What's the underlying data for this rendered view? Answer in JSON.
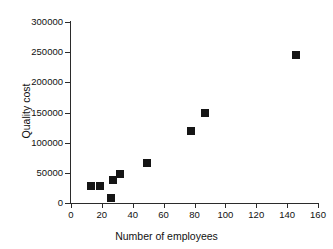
{
  "chart_data": {
    "type": "scatter",
    "title": "",
    "xlabel": "Number of employees",
    "ylabel": "Quality cost",
    "xlim": [
      0,
      160
    ],
    "ylim": [
      0,
      300000
    ],
    "xticks": [
      0,
      20,
      40,
      60,
      80,
      100,
      120,
      140,
      160
    ],
    "xtick_labels": [
      "0",
      "20",
      "40",
      "60",
      "80",
      "100",
      "120",
      "140",
      "160"
    ],
    "yticks": [
      0,
      50000,
      100000,
      150000,
      200000,
      250000,
      300000
    ],
    "ytick_labels": [
      "0",
      "50000",
      "100000",
      "150000",
      "200000",
      "250000",
      "300000"
    ],
    "grid": false,
    "legend": false,
    "marker_style": "filled-square",
    "marker_color": "#151515",
    "points": [
      {
        "x": 13,
        "y": 28000
      },
      {
        "x": 19,
        "y": 28000
      },
      {
        "x": 26,
        "y": 9000
      },
      {
        "x": 27,
        "y": 38000
      },
      {
        "x": 32,
        "y": 48000
      },
      {
        "x": 49,
        "y": 67000
      },
      {
        "x": 78,
        "y": 120000
      },
      {
        "x": 87,
        "y": 150000
      },
      {
        "x": 146,
        "y": 246000
      }
    ]
  },
  "axes": {
    "x_title": "Number of employees",
    "y_title": "Quality cost"
  }
}
